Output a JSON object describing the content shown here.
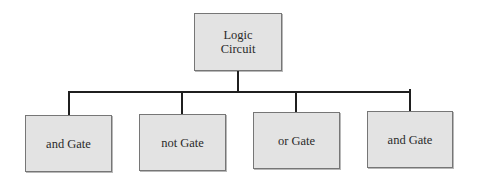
{
  "diagram": {
    "type": "tree",
    "root": {
      "label_line1": "Logic",
      "label_line2": "Circuit"
    },
    "children": [
      {
        "label": "and Gate"
      },
      {
        "label": "not Gate"
      },
      {
        "label": "or Gate"
      },
      {
        "label": "and Gate"
      }
    ],
    "colors": {
      "node_fill": "#e3e3e3",
      "node_border": "#767676",
      "connector": "#1f1f1f",
      "text": "#2a2a2a"
    }
  }
}
